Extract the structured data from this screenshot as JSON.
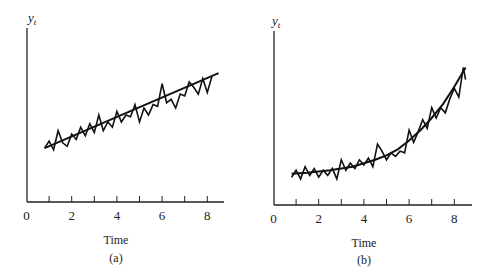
{
  "chart_data": [
    {
      "type": "line",
      "panel_label": "(a)",
      "title": "",
      "xlabel": "Time",
      "ylabel": "y_t",
      "ylabel_main": "y",
      "ylabel_sub": "t",
      "xlim": [
        0,
        8.7
      ],
      "ylim": [
        0,
        10
      ],
      "xticks": [
        1,
        2,
        3,
        4,
        5,
        6,
        7,
        8
      ],
      "xtick_labels": [
        "0",
        "2",
        "4",
        "6",
        "8"
      ],
      "xtick_label_values": [
        0,
        2,
        4,
        6,
        8
      ],
      "grid": false,
      "legend": null,
      "series": [
        {
          "name": "observed series",
          "x": [
            0.8,
            1.0,
            1.2,
            1.4,
            1.6,
            1.8,
            2.0,
            2.2,
            2.4,
            2.6,
            2.8,
            3.0,
            3.2,
            3.4,
            3.6,
            3.8,
            4.0,
            4.2,
            4.4,
            4.6,
            4.8,
            5.0,
            5.2,
            5.4,
            5.6,
            5.8,
            6.0,
            6.2,
            6.4,
            6.6,
            6.8,
            7.0,
            7.2,
            7.4,
            7.6,
            7.8,
            8.0,
            8.2
          ],
          "values": [
            3.1,
            3.5,
            3.0,
            4.1,
            3.4,
            3.2,
            3.9,
            3.6,
            4.3,
            3.8,
            4.5,
            4.0,
            5.0,
            4.1,
            4.6,
            4.3,
            5.2,
            4.6,
            5.0,
            4.9,
            5.6,
            4.6,
            5.4,
            5.0,
            5.6,
            5.5,
            6.8,
            5.7,
            5.9,
            5.4,
            6.2,
            6.1,
            6.9,
            6.6,
            6.2,
            7.1,
            6.3,
            7.2
          ]
        },
        {
          "name": "linear trend",
          "x": [
            0.8,
            8.5
          ],
          "values": [
            3.1,
            7.4
          ]
        }
      ]
    },
    {
      "type": "line",
      "panel_label": "(b)",
      "title": "",
      "xlabel": "Time",
      "ylabel": "y_t",
      "ylabel_main": "y",
      "ylabel_sub": "t",
      "xlim": [
        0,
        8.8
      ],
      "ylim": [
        0,
        10
      ],
      "xticks": [
        1,
        2,
        3,
        4,
        5,
        6,
        7,
        8
      ],
      "xtick_labels": [
        "0",
        "2",
        "4",
        "6",
        "8"
      ],
      "xtick_label_values": [
        0,
        2,
        4,
        6,
        8
      ],
      "grid": false,
      "legend": null,
      "series": [
        {
          "name": "observed series",
          "x": [
            0.8,
            1.0,
            1.2,
            1.4,
            1.6,
            1.8,
            2.0,
            2.2,
            2.4,
            2.6,
            2.8,
            3.0,
            3.2,
            3.4,
            3.6,
            3.8,
            4.0,
            4.2,
            4.4,
            4.6,
            4.8,
            5.0,
            5.2,
            5.4,
            5.6,
            5.8,
            6.0,
            6.2,
            6.4,
            6.6,
            6.8,
            7.0,
            7.2,
            7.4,
            7.6,
            7.8,
            8.0,
            8.2,
            8.4,
            8.5
          ],
          "values": [
            1.6,
            2.0,
            1.5,
            2.2,
            1.7,
            2.1,
            1.6,
            2.0,
            1.7,
            2.1,
            1.5,
            2.6,
            2.0,
            2.4,
            2.1,
            2.6,
            2.3,
            2.7,
            2.2,
            3.5,
            3.1,
            2.6,
            3.0,
            2.8,
            3.1,
            3.0,
            4.3,
            3.6,
            4.2,
            4.9,
            4.4,
            5.6,
            5.0,
            5.6,
            5.3,
            6.1,
            6.7,
            6.2,
            7.9,
            7.2
          ]
        },
        {
          "name": "exponential trend",
          "x": [
            0.8,
            1.5,
            2.5,
            3.5,
            4.0,
            4.5,
            5.0,
            5.5,
            6.0,
            6.5,
            7.0,
            7.5,
            8.0,
            8.5
          ],
          "values": [
            1.8,
            1.85,
            2.0,
            2.2,
            2.4,
            2.6,
            2.85,
            3.2,
            3.7,
            4.3,
            5.0,
            5.8,
            6.8,
            7.9
          ]
        }
      ]
    }
  ]
}
